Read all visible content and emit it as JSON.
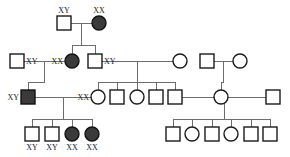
{
  "figure": {
    "kind": "pedigree-chart",
    "width": 290,
    "height": 157,
    "background": "#ffffff",
    "line_color": "#6d6d6d",
    "symbol_stroke": "#1a1a1a",
    "affected_fill": "#3a3a3a",
    "unaffected_fill": "#ffffff",
    "label_color": "#1a1a1a"
  },
  "legend_semantics": {
    "square": "male",
    "circle": "female",
    "filled": "affected",
    "open": "unaffected"
  },
  "chart_data": {
    "type": "diagram",
    "title": "",
    "generations": [
      {
        "id": "I",
        "y": 23,
        "members": [
          {
            "id": "I-1",
            "sex": "male",
            "shape": "square",
            "affected": false,
            "x": 64,
            "y": 23,
            "label": "XY",
            "label_pos": "above"
          },
          {
            "id": "I-2",
            "sex": "female",
            "shape": "circle",
            "affected": true,
            "x": 99,
            "y": 23,
            "label": "XX",
            "label_pos": "above"
          }
        ]
      },
      {
        "id": "II",
        "y": 61,
        "members": [
          {
            "id": "II-1",
            "sex": "male",
            "shape": "square",
            "affected": false,
            "x": 17,
            "y": 61,
            "label": "XY",
            "label_pos": "right"
          },
          {
            "id": "II-2",
            "sex": "female",
            "shape": "circle",
            "affected": true,
            "x": 72,
            "y": 61,
            "label": "XX",
            "label_pos": "left"
          },
          {
            "id": "II-3",
            "sex": "male",
            "shape": "square",
            "affected": false,
            "x": 95,
            "y": 61,
            "label": "XY",
            "label_pos": "right"
          },
          {
            "id": "II-4",
            "sex": "female",
            "shape": "circle",
            "affected": false,
            "x": 180,
            "y": 61,
            "label": "",
            "label_pos": "none"
          },
          {
            "id": "II-5",
            "sex": "male",
            "shape": "square",
            "affected": false,
            "x": 207,
            "y": 61,
            "label": "",
            "label_pos": "none"
          },
          {
            "id": "II-6",
            "sex": "female",
            "shape": "circle",
            "affected": false,
            "x": 240,
            "y": 61,
            "label": "",
            "label_pos": "none"
          }
        ]
      },
      {
        "id": "III",
        "y": 97,
        "members": [
          {
            "id": "III-1",
            "sex": "male",
            "shape": "square",
            "affected": true,
            "x": 28,
            "y": 97,
            "label": "XY",
            "label_pos": "left"
          },
          {
            "id": "III-2",
            "sex": "female",
            "shape": "circle",
            "affected": false,
            "x": 98,
            "y": 97,
            "label": "XX",
            "label_pos": "left"
          },
          {
            "id": "III-3",
            "sex": "male",
            "shape": "square",
            "affected": false,
            "x": 117,
            "y": 97,
            "label": "",
            "label_pos": "none"
          },
          {
            "id": "III-4",
            "sex": "female",
            "shape": "circle",
            "affected": false,
            "x": 137,
            "y": 97,
            "label": "",
            "label_pos": "none"
          },
          {
            "id": "III-5",
            "sex": "male",
            "shape": "square",
            "affected": false,
            "x": 156,
            "y": 97,
            "label": "",
            "label_pos": "none"
          },
          {
            "id": "III-6",
            "sex": "male",
            "shape": "square",
            "affected": false,
            "x": 175,
            "y": 97,
            "label": "",
            "label_pos": "none"
          },
          {
            "id": "III-7",
            "sex": "female",
            "shape": "circle",
            "affected": false,
            "x": 221,
            "y": 97,
            "label": "",
            "label_pos": "none"
          },
          {
            "id": "III-8",
            "sex": "male",
            "shape": "square",
            "affected": false,
            "x": 273,
            "y": 97,
            "label": "",
            "label_pos": "none"
          }
        ]
      },
      {
        "id": "IV",
        "y": 134,
        "members": [
          {
            "id": "IV-1",
            "sex": "male",
            "shape": "square",
            "affected": false,
            "x": 32,
            "y": 134,
            "label": "XY",
            "label_pos": "below"
          },
          {
            "id": "IV-2",
            "sex": "male",
            "shape": "square",
            "affected": false,
            "x": 52,
            "y": 134,
            "label": "XY",
            "label_pos": "below"
          },
          {
            "id": "IV-3",
            "sex": "female",
            "shape": "circle",
            "affected": true,
            "x": 72,
            "y": 134,
            "label": "XX",
            "label_pos": "below"
          },
          {
            "id": "IV-4",
            "sex": "female",
            "shape": "circle",
            "affected": true,
            "x": 92,
            "y": 134,
            "label": "XX",
            "label_pos": "below"
          },
          {
            "id": "IV-5",
            "sex": "male",
            "shape": "square",
            "affected": false,
            "x": 173,
            "y": 134,
            "label": "",
            "label_pos": "none"
          },
          {
            "id": "IV-6",
            "sex": "female",
            "shape": "circle",
            "affected": false,
            "x": 192,
            "y": 134,
            "label": "",
            "label_pos": "none"
          },
          {
            "id": "IV-7",
            "sex": "male",
            "shape": "square",
            "affected": false,
            "x": 212,
            "y": 134,
            "label": "",
            "label_pos": "none"
          },
          {
            "id": "IV-8",
            "sex": "female",
            "shape": "circle",
            "affected": false,
            "x": 231,
            "y": 134,
            "label": "",
            "label_pos": "none"
          },
          {
            "id": "IV-9",
            "sex": "male",
            "shape": "square",
            "affected": false,
            "x": 251,
            "y": 134,
            "label": "",
            "label_pos": "none"
          },
          {
            "id": "IV-10",
            "sex": "male",
            "shape": "square",
            "affected": false,
            "x": 270,
            "y": 134,
            "label": "",
            "label_pos": "none"
          }
        ]
      }
    ],
    "matings": [
      {
        "id": "M1",
        "partners": [
          "I-1",
          "I-2"
        ],
        "sib_y": 45,
        "children": [
          "II-2",
          "II-3"
        ]
      },
      {
        "id": "M2",
        "partners": [
          "II-1",
          "II-2"
        ],
        "sib_y": 82,
        "children": [
          "III-1"
        ]
      },
      {
        "id": "M3",
        "partners": [
          "II-3",
          "II-4"
        ],
        "sib_y": 82,
        "children": [
          "III-2",
          "III-3",
          "III-4",
          "III-5",
          "III-6"
        ]
      },
      {
        "id": "M4",
        "partners": [
          "II-5",
          "II-6"
        ],
        "sib_y": 82,
        "children": [
          "III-7"
        ]
      },
      {
        "id": "M5",
        "partners": [
          "III-1",
          "III-2"
        ],
        "sib_y": 119,
        "children": [
          "IV-1",
          "IV-2",
          "IV-3",
          "IV-4"
        ]
      },
      {
        "id": "M6",
        "partners": [
          "III-6",
          "III-7",
          "III-8"
        ],
        "sib_y": 119,
        "children": [
          "IV-5",
          "IV-6",
          "IV-7",
          "IV-8",
          "IV-9",
          "IV-10"
        ]
      }
    ],
    "karyotype_labels": [
      {
        "text": "XY",
        "x": 64,
        "y": 23,
        "anchor": "above"
      },
      {
        "text": "XX",
        "x": 99,
        "y": 23,
        "anchor": "above"
      },
      {
        "text": "XY",
        "x": 17,
        "y": 61,
        "anchor": "right"
      },
      {
        "text": "XX",
        "x": 72,
        "y": 61,
        "anchor": "left"
      },
      {
        "text": "XY",
        "x": 95,
        "y": 61,
        "anchor": "right"
      },
      {
        "text": "XY",
        "x": 28,
        "y": 97,
        "anchor": "left"
      },
      {
        "text": "XX",
        "x": 98,
        "y": 97,
        "anchor": "left"
      },
      {
        "text": "XY",
        "x": 32,
        "y": 134,
        "anchor": "below"
      },
      {
        "text": "XY",
        "x": 52,
        "y": 134,
        "anchor": "below"
      },
      {
        "text": "XX",
        "x": 72,
        "y": 134,
        "anchor": "below"
      },
      {
        "text": "XX",
        "x": 92,
        "y": 134,
        "anchor": "below"
      }
    ]
  }
}
